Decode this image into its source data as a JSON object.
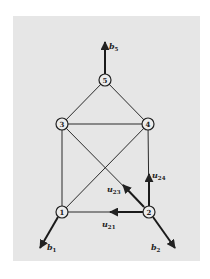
{
  "diagram": {
    "title": "",
    "background_color": "#e6e6e6",
    "line_color": "#222222",
    "nodes": [
      {
        "id": "1",
        "label": "1",
        "x": 62,
        "y": 212
      },
      {
        "id": "2",
        "label": "2",
        "x": 149,
        "y": 212
      },
      {
        "id": "3",
        "label": "3",
        "x": 62,
        "y": 124
      },
      {
        "id": "4",
        "label": "4",
        "x": 148,
        "y": 124
      },
      {
        "id": "5",
        "label": "5",
        "x": 105,
        "y": 80
      }
    ],
    "edges": [
      {
        "from": "1",
        "to": "2"
      },
      {
        "from": "1",
        "to": "3"
      },
      {
        "from": "1",
        "to": "4"
      },
      {
        "from": "2",
        "to": "3"
      },
      {
        "from": "2",
        "to": "4"
      },
      {
        "from": "3",
        "to": "4"
      },
      {
        "from": "3",
        "to": "5"
      },
      {
        "from": "4",
        "to": "5"
      }
    ],
    "load_vectors": [
      {
        "name": "b1",
        "base": "b",
        "sub": "1",
        "node": "1",
        "direction": "down-left"
      },
      {
        "name": "b2",
        "base": "b",
        "sub": "2",
        "node": "2",
        "direction": "down-right"
      },
      {
        "name": "b5",
        "base": "b",
        "sub": "5",
        "node": "5",
        "direction": "up"
      }
    ],
    "displacement_vectors": [
      {
        "name": "u21",
        "base": "u",
        "sub": "21",
        "node": "2",
        "toward": "1"
      },
      {
        "name": "u23",
        "base": "u",
        "sub": "23",
        "node": "2",
        "toward": "3"
      },
      {
        "name": "u24",
        "base": "u",
        "sub": "24",
        "node": "2",
        "toward": "4"
      }
    ]
  },
  "labels": {
    "n1": "1",
    "n2": "2",
    "n3": "3",
    "n4": "4",
    "n5": "5",
    "b": "b",
    "u": "u",
    "b1_sub": "1",
    "b2_sub": "2",
    "b5_sub": "5",
    "u21_sub": "21",
    "u23_sub": "23",
    "u24_sub": "24"
  }
}
